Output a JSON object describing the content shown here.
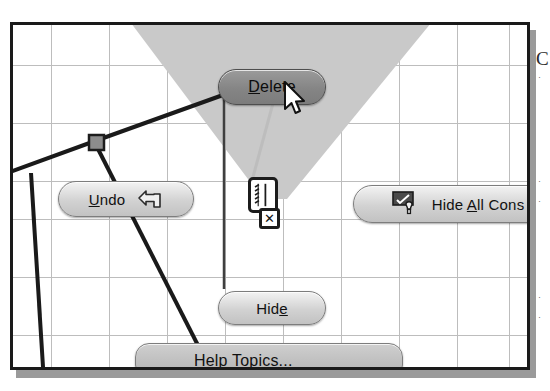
{
  "app": {
    "context": "cad-sketch-context-menu",
    "description": "CAD sketch graphics area with right-click context menu over a selected sketch constraint"
  },
  "canvas": {
    "background_color": "#ffffff",
    "grid_color": "#bdbdbd",
    "grid_spacing_px": 58,
    "border_color": "#1a1a1a",
    "highlight_wedge_color": "#c9c9c9"
  },
  "sketch": {
    "line_color": "#1a1a1a",
    "point_color": "#8c8c8c",
    "elements": [
      {
        "name": "upper-sketch-line",
        "type": "line"
      },
      {
        "name": "left-sketch-line",
        "type": "line"
      },
      {
        "name": "lower-diagonal-line",
        "type": "line"
      },
      {
        "name": "second-diagonal-line",
        "type": "line"
      },
      {
        "name": "sketch-point-handle",
        "type": "point"
      }
    ]
  },
  "constraint": {
    "name": "parallel-constraint-symbol",
    "delete_badge": "✕",
    "leader_line_color": "#4a4a4a"
  },
  "menu": {
    "delete": {
      "label_before": "",
      "mnemonic": "D",
      "label_after": "elete",
      "full": "Delete",
      "state": "highlighted"
    },
    "undo": {
      "label_before": "",
      "mnemonic": "U",
      "label_after": "ndo",
      "full": "Undo",
      "icon": "undo-arrow-icon"
    },
    "hide": {
      "label_before": "Hid",
      "mnemonic": "e",
      "label_after": "",
      "full": "Hide"
    },
    "hide_all_constraints": {
      "label_before": "Hide ",
      "mnemonic": "A",
      "label_after": "ll Cons",
      "full": "Hide All Cons",
      "truncated": true,
      "icon": "hide-constraints-icon"
    },
    "help_topics": {
      "label_before": "",
      "mnemonic": "H",
      "label_after": "elp Topics...",
      "full": "Help Topics..."
    }
  },
  "cursor": {
    "name": "mouse-pointer",
    "x": 270,
    "y": 56
  },
  "margin": {
    "glyph": "C",
    "ticks": [
      "·",
      "·",
      "·",
      "·",
      "·"
    ]
  }
}
